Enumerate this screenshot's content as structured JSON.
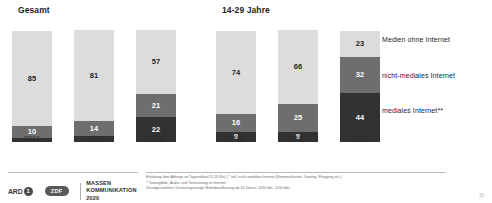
{
  "panels": {
    "left": {
      "title": "Gesamt"
    },
    "right": {
      "title": "14-29 Jahre"
    }
  },
  "legend": {
    "items": [
      {
        "label": "Medien ohne Internet",
        "color": "#dcdcdc",
        "key": "medien-ohne-internet"
      },
      {
        "label": "nicht-mediales Internet",
        "color": "#6e6e6e",
        "key": "nicht-mediales-internet"
      },
      {
        "label": "mediales Internet**",
        "color": "#323232",
        "key": "mediales-internet"
      }
    ]
  },
  "footer": {
    "logo_ard": "ARD",
    "logo_ard_mark": "1",
    "logo_zdf": "ZDF",
    "brand_line1": "MASSEN",
    "brand_line2": "KOMMUNIKATION",
    "brand_line3": "2020",
    "page_number": "36"
  },
  "footnotes": {
    "line1": "Erhebung über Abfrage an Tagesablauf (5.24 Uhr) | * inkl. nicht-mediales Internet (Kommunikation, Gaming, Shopping etc.)",
    "line2": "** bewegtbild-, Audio- und Textnutzung im Internet",
    "line3": "Grundgesamtheit: Deutschsprachige Wohnbevölkerung ab 14 Jahren; 2020 bbc. 2010 bbc."
  },
  "chart_data": [
    {
      "type": "bar",
      "title": "Gesamt",
      "subtitle": "",
      "xlabel": "",
      "ylabel": "",
      "stacked": true,
      "unit": "%",
      "ylim": [
        0,
        100
      ],
      "grid": false,
      "legend_position": "right",
      "categories": [
        "2010",
        "2015",
        "2020"
      ],
      "series": [
        {
          "name": "Medien ohne Internet",
          "color": "#dcdcdc",
          "values": [
            85,
            81,
            57
          ]
        },
        {
          "name": "nicht-mediales Internet",
          "color": "#6e6e6e",
          "values": [
            10,
            14,
            21
          ]
        },
        {
          "name": "mediales Internet**",
          "color": "#323232",
          "values": [
            4,
            5,
            22
          ]
        }
      ],
      "labels": {
        "2010": {
          "Medien ohne Internet": "85",
          "nicht-mediales Internet": "10",
          "mediales Internet**": ""
        },
        "2015": {
          "Medien ohne Internet": "81",
          "nicht-mediales Internet": "14",
          "mediales Internet**": "5"
        },
        "2020": {
          "Medien ohne Internet": "57",
          "nicht-mediales Internet": "21",
          "mediales Internet**": "22"
        }
      }
    },
    {
      "type": "bar",
      "title": "14-29 Jahre",
      "subtitle": "",
      "xlabel": "",
      "ylabel": "",
      "stacked": true,
      "unit": "%",
      "ylim": [
        0,
        100
      ],
      "grid": false,
      "legend_position": "right",
      "categories": [
        "2010",
        "2015",
        "2020"
      ],
      "series": [
        {
          "name": "Medien ohne Internet",
          "color": "#dcdcdc",
          "values": [
            74,
            66,
            23
          ]
        },
        {
          "name": "nicht-mediales Internet",
          "color": "#6e6e6e",
          "values": [
            16,
            25,
            32
          ]
        },
        {
          "name": "mediales Internet**",
          "color": "#323232",
          "values": [
            9,
            9,
            44
          ]
        }
      ],
      "labels": {
        "2010": {
          "Medien ohne Internet": "74",
          "nicht-mediales Internet": "16",
          "mediales Internet**": "9"
        },
        "2015": {
          "Medien ohne Internet": "66",
          "nicht-mediales Internet": "25",
          "mediales Internet**": "9"
        },
        "2020": {
          "Medien ohne Internet": "23",
          "nicht-mediales Internet": "32",
          "mediales Internet**": "44"
        }
      }
    }
  ]
}
